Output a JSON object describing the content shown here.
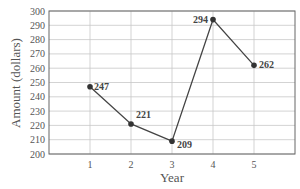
{
  "chart_data": {
    "type": "line",
    "title": "",
    "xlabel": "Year",
    "ylabel": "Amount (dollars)",
    "x": [
      1,
      2,
      3,
      4,
      5
    ],
    "categories": [
      "1",
      "2",
      "3",
      "4",
      "5"
    ],
    "values": [
      247,
      221,
      209,
      294,
      262
    ],
    "series": [
      {
        "name": "Amount",
        "values": [
          247,
          221,
          209,
          294,
          262
        ]
      }
    ],
    "data_labels": [
      "247",
      "221",
      "209",
      "294",
      "262"
    ],
    "xlim": [
      0,
      6
    ],
    "ylim": [
      200,
      300
    ],
    "xticks": [
      "1",
      "2",
      "3",
      "4",
      "5"
    ],
    "yticks": [
      "200",
      "210",
      "220",
      "230",
      "240",
      "250",
      "260",
      "270",
      "280",
      "290",
      "300"
    ],
    "grid": true,
    "legend": "none",
    "colors": {
      "line": "#444444",
      "marker": "#333333",
      "grid": "#c8c8c8",
      "axis": "#555555",
      "text": "#555555"
    }
  }
}
